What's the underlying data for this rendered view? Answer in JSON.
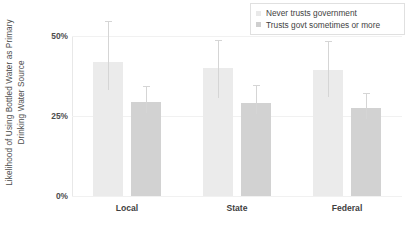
{
  "chart_data": {
    "type": "bar",
    "title": "",
    "xlabel": "",
    "ylabel_line1": "Likelihood of Using Bottled Water as Primary",
    "ylabel_line2": "Drinking Water Source",
    "categories": [
      "Local",
      "State",
      "Federal"
    ],
    "ylim": [
      0,
      50
    ],
    "yticks": [
      {
        "value": 50,
        "label": "50%"
      },
      {
        "value": 25,
        "label": "25%"
      },
      {
        "value": 0,
        "label": "0%"
      }
    ],
    "grid": true,
    "legend_position": "top-right",
    "series": [
      {
        "name": "Never trusts government",
        "color": "#ebebeb",
        "values": [
          42.0,
          40.0,
          39.5
        ],
        "error_low": [
          33.0,
          30.5,
          31.0
        ],
        "error_high": [
          54.5,
          48.5,
          48.0
        ]
      },
      {
        "name": "Trusts govt sometimes or more",
        "color": "#d2d2d2",
        "values": [
          29.5,
          29.0,
          27.5
        ],
        "error_low": [
          26.0,
          25.5,
          24.0
        ],
        "error_high": [
          34.0,
          34.5,
          32.0
        ]
      }
    ]
  }
}
